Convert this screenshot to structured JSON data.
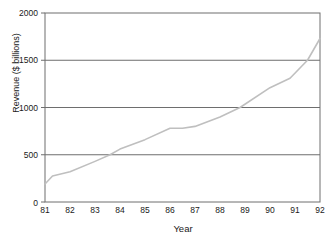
{
  "chart_data": {
    "type": "line",
    "title": "",
    "xlabel": "Year",
    "ylabel": "Revenue ($ billions)",
    "xlim": [
      81,
      92
    ],
    "ylim": [
      0,
      2000
    ],
    "yticks": [
      0,
      500,
      1000,
      1500,
      2000
    ],
    "xticks": [
      "81",
      "82",
      "83",
      "84",
      "85",
      "86",
      "87",
      "88",
      "89",
      "90",
      "91",
      "92"
    ],
    "grid": "horizontal",
    "legend": "none",
    "series": [
      {
        "name": "Revenue",
        "color": "#bfbfbf",
        "x": [
          81,
          81.3,
          82,
          83,
          83.6,
          84,
          85,
          86,
          86.5,
          87,
          88,
          88.8,
          90,
          90.8,
          91.5,
          92
        ],
        "values": [
          190,
          275,
          320,
          430,
          500,
          560,
          660,
          780,
          780,
          800,
          900,
          1000,
          1210,
          1310,
          1500,
          1730
        ]
      }
    ]
  },
  "axes": {
    "ytick_labels": [
      "2000",
      "1500",
      "1000",
      "500",
      "0"
    ],
    "ylabel_text": "Revenue ($ billions)",
    "xlabel_text": "Year"
  },
  "style": {
    "line_color": "#bfbfbf",
    "grid_color": "#6e6e6e",
    "frame_color": "#6e6e6e",
    "text_color": "#1a1a1a",
    "background": "#ffffff"
  }
}
